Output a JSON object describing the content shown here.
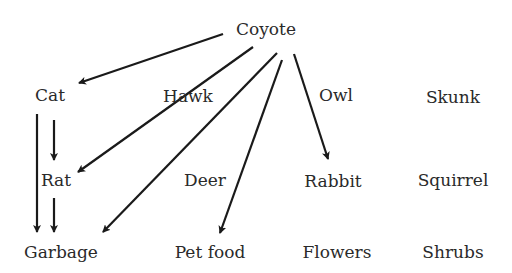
{
  "colors": {
    "text": "#2a2a2a",
    "arrow": "#1a1a1a",
    "background": "#ffffff"
  },
  "nodes": {
    "coyote": {
      "label": "Coyote",
      "x": 266,
      "y": 29
    },
    "cat": {
      "label": "Cat",
      "x": 50,
      "y": 95
    },
    "hawk": {
      "label": "Hawk",
      "x": 188,
      "y": 96
    },
    "owl": {
      "label": "Owl",
      "x": 336,
      "y": 95
    },
    "skunk": {
      "label": "Skunk",
      "x": 453,
      "y": 97
    },
    "rat": {
      "label": "Rat",
      "x": 56,
      "y": 180
    },
    "deer": {
      "label": "Deer",
      "x": 205,
      "y": 180
    },
    "rabbit": {
      "label": "Rabbit",
      "x": 333,
      "y": 181
    },
    "squirrel": {
      "label": "Squirrel",
      "x": 453,
      "y": 180
    },
    "garbage": {
      "label": "Garbage",
      "x": 61,
      "y": 252
    },
    "petfood": {
      "label": "Pet food",
      "x": 210,
      "y": 252
    },
    "flowers": {
      "label": "Flowers",
      "x": 337,
      "y": 252
    },
    "shrubs": {
      "label": "Shrubs",
      "x": 453,
      "y": 252
    }
  },
  "edges": [
    {
      "from": "Coyote",
      "to": "Cat",
      "x1": 223,
      "y1": 34,
      "x2": 79,
      "y2": 83
    },
    {
      "from": "Coyote",
      "to": "Rat",
      "x1": 253,
      "y1": 47,
      "x2": 78,
      "y2": 172,
      "via": "Hawk (line passes behind label)"
    },
    {
      "from": "Coyote",
      "to": "Garbage",
      "x1": 277,
      "y1": 53,
      "x2": 103,
      "y2": 232
    },
    {
      "from": "Coyote",
      "to": "Pet food",
      "x1": 282,
      "y1": 60,
      "x2": 220,
      "y2": 233
    },
    {
      "from": "Coyote",
      "to": "Rabbit",
      "x1": 294,
      "y1": 54,
      "x2": 328,
      "y2": 159
    },
    {
      "from": "Cat",
      "to": "Rat",
      "x1": 54,
      "y1": 120,
      "x2": 54,
      "y2": 160
    },
    {
      "from": "Cat",
      "to": "Garbage",
      "x1": 37,
      "y1": 114,
      "x2": 37,
      "y2": 232
    },
    {
      "from": "Rat",
      "to": "Garbage",
      "x1": 54,
      "y1": 198,
      "x2": 54,
      "y2": 232
    }
  ]
}
